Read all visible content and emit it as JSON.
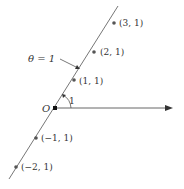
{
  "diagram": {
    "type": "polar-coordinates",
    "origin_label": "O",
    "angle_label": "1",
    "line_label": "θ = 1",
    "colors": {
      "line": "#555555",
      "point": "#555555",
      "axis": "#444444",
      "text": "#333333"
    },
    "points": [
      {
        "label": "(3, 1)",
        "x": 114,
        "y": 23
      },
      {
        "label": "(2, 1)",
        "x": 94,
        "y": 52
      },
      {
        "label": "(1, 1)",
        "x": 74,
        "y": 80
      },
      {
        "label": "(−1, 1)",
        "x": 36,
        "y": 138
      },
      {
        "label": "(−2, 1)",
        "x": 16,
        "y": 167
      }
    ]
  }
}
